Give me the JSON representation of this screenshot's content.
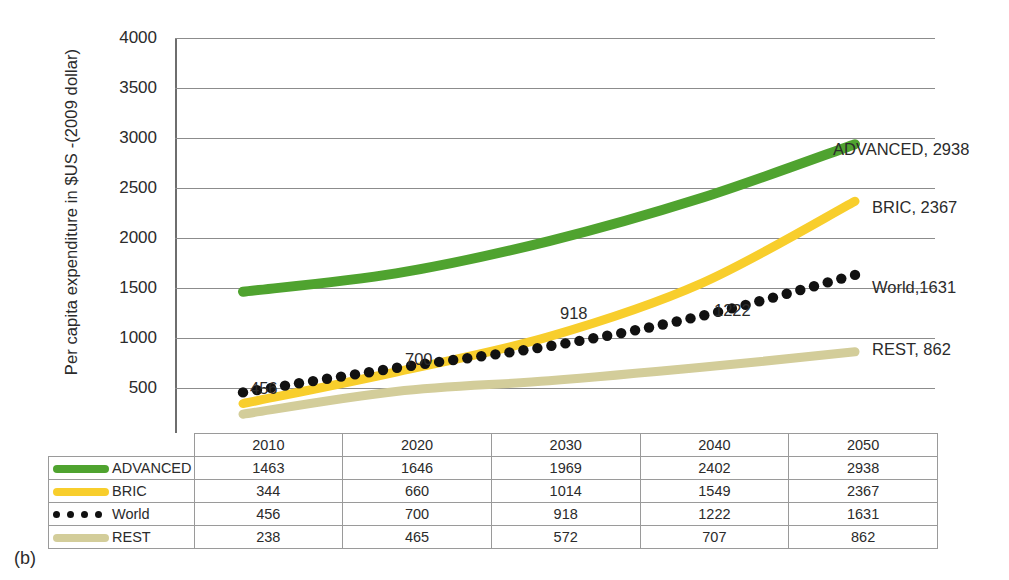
{
  "caption": "(b)",
  "chart_data": {
    "type": "line",
    "title": "",
    "xlabel": "",
    "ylabel": "Per capita expenditure in $US -(2009 dollar)",
    "categories": [
      "2010",
      "2020",
      "2030",
      "2040",
      "2050"
    ],
    "ylim": [
      0,
      4000
    ],
    "y_ticks": [
      "-",
      "500",
      "1000",
      "1500",
      "2000",
      "2500",
      "3000",
      "3500",
      "4000"
    ],
    "grid": true,
    "legend_position": "right",
    "series": [
      {
        "name": "ADVANCED",
        "color": "#4FA32F",
        "style": "solid-line",
        "values": [
          1463,
          1646,
          1969,
          2402,
          2938
        ],
        "end_label": "ADVANCED, 2938"
      },
      {
        "name": "BRIC",
        "color": "#F8CE2C",
        "style": "solid-line",
        "values": [
          344,
          660,
          1014,
          1549,
          2367
        ],
        "end_label": "BRIC, 2367"
      },
      {
        "name": "World",
        "color": "#111111",
        "style": "dotted-markers",
        "values": [
          456,
          700,
          918,
          1222,
          1631
        ],
        "end_label": "World,1631",
        "point_labels": [
          "456",
          "700",
          "918",
          "1222"
        ]
      },
      {
        "name": "REST",
        "color": "#D3CD9A",
        "style": "solid-line",
        "values": [
          238,
          465,
          572,
          707,
          862
        ],
        "end_label": "REST, 862"
      }
    ],
    "table": {
      "corner": "",
      "columns": [
        "2010",
        "2020",
        "2030",
        "2040",
        "2050"
      ],
      "rows": [
        {
          "label": "ADVANCED",
          "swatch": "green-line-swatch",
          "values": [
            "1463",
            "1646",
            "1969",
            "2402",
            "2938"
          ]
        },
        {
          "label": "BRIC",
          "swatch": "yellow-line-swatch",
          "values": [
            "344",
            "660",
            "1014",
            "1549",
            "2367"
          ]
        },
        {
          "label": "World",
          "swatch": "black-dots-swatch",
          "values": [
            "456",
            "700",
            "918",
            "1222",
            "1631"
          ]
        },
        {
          "label": "REST",
          "swatch": "tan-line-swatch",
          "values": [
            "238",
            "465",
            "572",
            "707",
            "862"
          ]
        }
      ]
    }
  }
}
